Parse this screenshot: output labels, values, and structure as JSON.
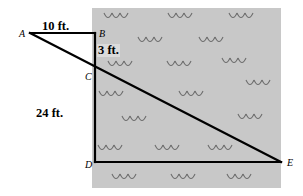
{
  "figure": {
    "background_color": "#ffffff",
    "field_color": "#c8c8c8",
    "line_color": "#000000"
  },
  "points": [
    {
      "id": "A",
      "label": "A",
      "x": 30,
      "y": 33
    },
    {
      "id": "B",
      "label": "B",
      "x": 95,
      "y": 33
    },
    {
      "id": "C",
      "label": "C",
      "x": 95,
      "y": 71
    },
    {
      "id": "D",
      "label": "D",
      "x": 95,
      "y": 162
    },
    {
      "id": "E",
      "label": "E",
      "x": 281,
      "y": 162
    }
  ],
  "dimensions": [
    {
      "id": "AB",
      "label": "10 ft.",
      "x": 42,
      "y": 20,
      "on_field": false
    },
    {
      "id": "BC",
      "label": "3 ft.",
      "x": 97,
      "y": 44,
      "on_field": true
    },
    {
      "id": "CD",
      "label": "24 ft.",
      "x": 36,
      "y": 107,
      "on_field": false
    }
  ],
  "segments": [
    {
      "id": "AB",
      "from": "A",
      "to": "B"
    },
    {
      "id": "BD",
      "from": "B",
      "to": "D"
    },
    {
      "id": "DE",
      "from": "D",
      "to": "E"
    },
    {
      "id": "AE",
      "from": "A",
      "to": "E"
    }
  ],
  "field": {
    "x": 92,
    "y": 8,
    "width": 189,
    "height": 180
  },
  "grass_tufts": [
    {
      "x": 104,
      "y": 13
    },
    {
      "x": 168,
      "y": 13
    },
    {
      "x": 229,
      "y": 13
    },
    {
      "x": 138,
      "y": 37
    },
    {
      "x": 199,
      "y": 37
    },
    {
      "x": 108,
      "y": 61
    },
    {
      "x": 167,
      "y": 61
    },
    {
      "x": 222,
      "y": 58
    },
    {
      "x": 246,
      "y": 80
    },
    {
      "x": 99,
      "y": 91
    },
    {
      "x": 179,
      "y": 91
    },
    {
      "x": 122,
      "y": 116
    },
    {
      "x": 238,
      "y": 114
    },
    {
      "x": 98,
      "y": 145
    },
    {
      "x": 155,
      "y": 145
    },
    {
      "x": 208,
      "y": 145
    },
    {
      "x": 112,
      "y": 174
    },
    {
      "x": 171,
      "y": 174
    },
    {
      "x": 227,
      "y": 174
    }
  ]
}
